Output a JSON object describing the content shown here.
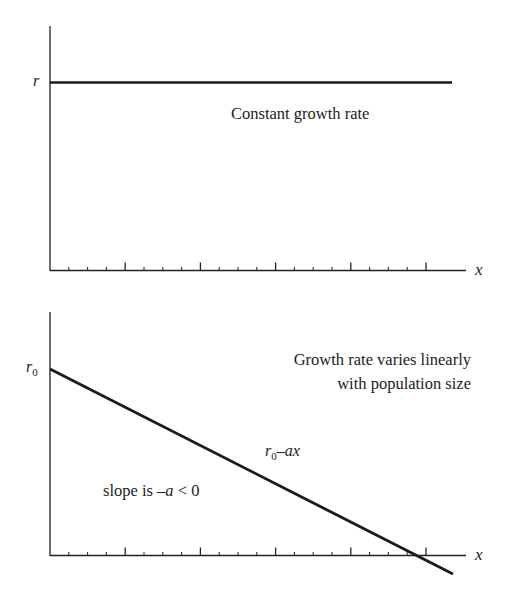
{
  "panels": [
    {
      "id": "constant",
      "y_axis_label": "r",
      "x_axis_label": "x",
      "caption": "Constant growth rate",
      "line": {
        "description": "horizontal line at r",
        "from": [
          0,
          1
        ],
        "to": [
          1,
          1
        ]
      }
    },
    {
      "id": "linear",
      "y_axis_label_main": "r",
      "y_axis_label_sub": "0",
      "x_axis_label": "x",
      "caption_line1": "Growth rate varies linearly",
      "caption_line2": "with population size",
      "line_label_main": "r",
      "line_label_sub": "0",
      "line_label_rest": "–ax",
      "slope_label_prefix": "slope is ",
      "slope_label_var": "–a",
      "slope_label_suffix": " < 0",
      "line": {
        "description": "decreasing line r0 - ax",
        "intercept": "r0",
        "slope": "-a"
      }
    }
  ],
  "chart_data": [
    {
      "type": "line",
      "title": "Constant growth rate",
      "xlabel": "x",
      "ylabel": "r",
      "series": [
        {
          "name": "r",
          "x": [
            0,
            20
          ],
          "y": [
            1,
            1
          ]
        }
      ],
      "x_ticks": {
        "major_every": 4,
        "count": 20,
        "labels": []
      },
      "grid": false
    },
    {
      "type": "line",
      "title": "Growth rate varies linearly with population size",
      "xlabel": "x",
      "ylabel": "r0",
      "series": [
        {
          "name": "r0-ax",
          "x": [
            0,
            21.2
          ],
          "y": [
            1,
            -0.1
          ]
        }
      ],
      "annotations": [
        "r0-ax",
        "slope is -a < 0"
      ],
      "x_ticks": {
        "major_every": 4,
        "count": 20,
        "labels": []
      },
      "grid": false
    }
  ]
}
